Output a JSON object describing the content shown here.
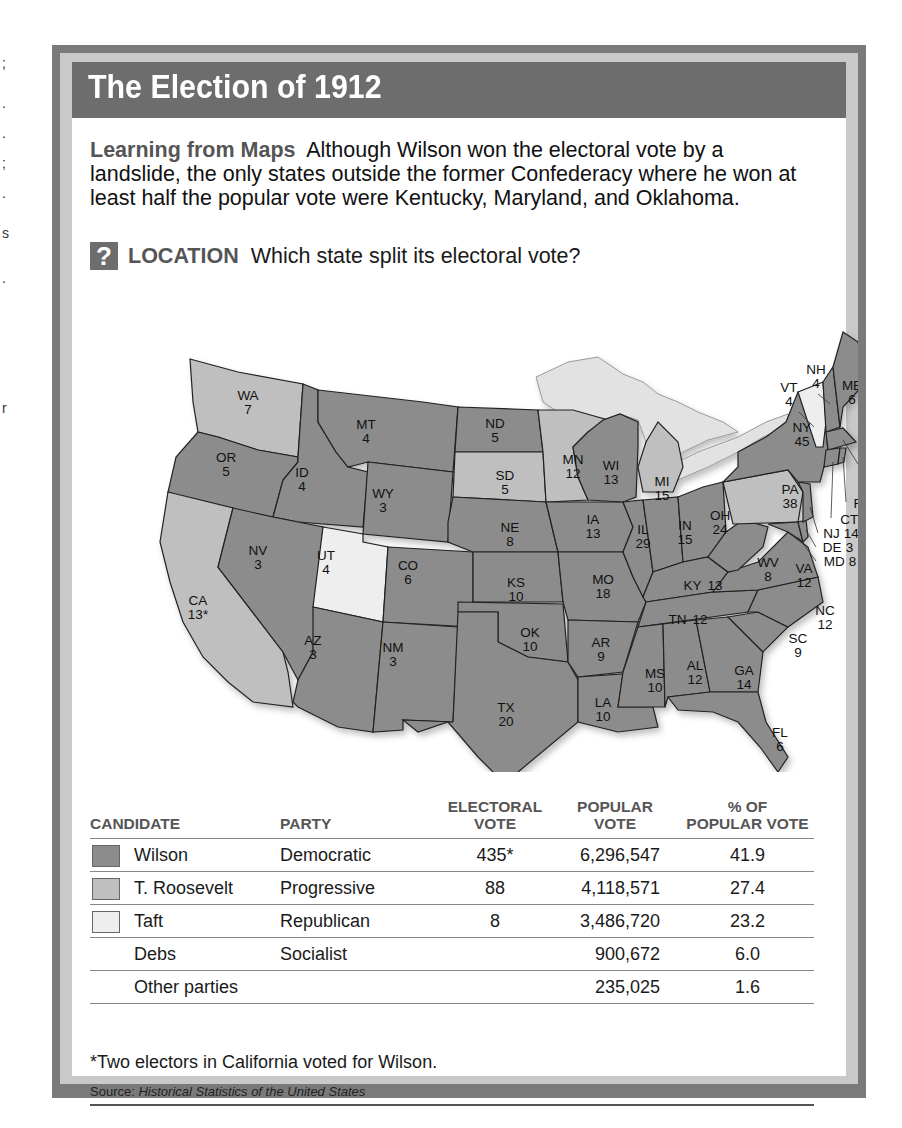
{
  "edge_marks": [
    ";",
    ".",
    ".",
    ";",
    ".",
    "s",
    ".",
    "r"
  ],
  "title": "The Election of 1912",
  "intro": {
    "lead": "Learning from Maps",
    "text": "Although Wilson won the electoral vote by a landslide, the only states outside the former Confederacy where he won at least half the popular vote were Kentucky, Maryland, and Oklahoma."
  },
  "question": {
    "icon": "?",
    "label": "LOCATION",
    "text": "Which state split its electoral vote?"
  },
  "colors": {
    "wilson": "#8c8c8c",
    "roosevelt": "#bfbfbf",
    "taft": "#eeeeee",
    "header": "#6d6d6d",
    "frame": "#7a7a7a",
    "lakes": "#e2e2e2"
  },
  "map": {
    "states": [
      {
        "abbr": "WA",
        "votes": "7",
        "winner": "roosevelt"
      },
      {
        "abbr": "OR",
        "votes": "5",
        "winner": "wilson"
      },
      {
        "abbr": "CA",
        "votes": "13*",
        "winner": "roosevelt"
      },
      {
        "abbr": "ID",
        "votes": "4",
        "winner": "wilson"
      },
      {
        "abbr": "NV",
        "votes": "3",
        "winner": "wilson"
      },
      {
        "abbr": "MT",
        "votes": "4",
        "winner": "wilson"
      },
      {
        "abbr": "WY",
        "votes": "3",
        "winner": "wilson"
      },
      {
        "abbr": "UT",
        "votes": "4",
        "winner": "taft"
      },
      {
        "abbr": "AZ",
        "votes": "3",
        "winner": "wilson"
      },
      {
        "abbr": "CO",
        "votes": "6",
        "winner": "wilson"
      },
      {
        "abbr": "NM",
        "votes": "3",
        "winner": "wilson"
      },
      {
        "abbr": "ND",
        "votes": "5",
        "winner": "wilson"
      },
      {
        "abbr": "SD",
        "votes": "5",
        "winner": "roosevelt"
      },
      {
        "abbr": "NE",
        "votes": "8",
        "winner": "wilson"
      },
      {
        "abbr": "KS",
        "votes": "10",
        "winner": "wilson"
      },
      {
        "abbr": "OK",
        "votes": "10",
        "winner": "wilson"
      },
      {
        "abbr": "TX",
        "votes": "20",
        "winner": "wilson"
      },
      {
        "abbr": "MN",
        "votes": "12",
        "winner": "roosevelt"
      },
      {
        "abbr": "IA",
        "votes": "13",
        "winner": "wilson"
      },
      {
        "abbr": "MO",
        "votes": "18",
        "winner": "wilson"
      },
      {
        "abbr": "AR",
        "votes": "9",
        "winner": "wilson"
      },
      {
        "abbr": "LA",
        "votes": "10",
        "winner": "wilson"
      },
      {
        "abbr": "WI",
        "votes": "13",
        "winner": "wilson"
      },
      {
        "abbr": "IL",
        "votes": "29",
        "winner": "wilson"
      },
      {
        "abbr": "MI",
        "votes": "15",
        "winner": "roosevelt"
      },
      {
        "abbr": "IN",
        "votes": "15",
        "winner": "wilson"
      },
      {
        "abbr": "OH",
        "votes": "24",
        "winner": "wilson"
      },
      {
        "abbr": "KY",
        "votes": "13",
        "winner": "wilson"
      },
      {
        "abbr": "TN",
        "votes": "12",
        "winner": "wilson"
      },
      {
        "abbr": "MS",
        "votes": "10",
        "winner": "wilson"
      },
      {
        "abbr": "AL",
        "votes": "12",
        "winner": "wilson"
      },
      {
        "abbr": "GA",
        "votes": "14",
        "winner": "wilson"
      },
      {
        "abbr": "FL",
        "votes": "6",
        "winner": "wilson"
      },
      {
        "abbr": "SC",
        "votes": "9",
        "winner": "wilson"
      },
      {
        "abbr": "NC",
        "votes": "12",
        "winner": "wilson"
      },
      {
        "abbr": "VA",
        "votes": "12",
        "winner": "wilson"
      },
      {
        "abbr": "WV",
        "votes": "8",
        "winner": "wilson"
      },
      {
        "abbr": "PA",
        "votes": "38",
        "winner": "roosevelt"
      },
      {
        "abbr": "NY",
        "votes": "45",
        "winner": "wilson"
      },
      {
        "abbr": "VT",
        "votes": "4",
        "winner": "taft"
      },
      {
        "abbr": "NH",
        "votes": "4",
        "winner": "wilson"
      },
      {
        "abbr": "ME",
        "votes": "6",
        "winner": "wilson"
      },
      {
        "abbr": "MA",
        "votes": "18",
        "winner": "wilson"
      },
      {
        "abbr": "RI",
        "votes": "5",
        "winner": "wilson"
      },
      {
        "abbr": "CT",
        "votes": "7",
        "winner": "wilson"
      },
      {
        "abbr": "NJ",
        "votes": "14",
        "winner": "wilson"
      },
      {
        "abbr": "DE",
        "votes": "3",
        "winner": "wilson"
      },
      {
        "abbr": "MD",
        "votes": "8",
        "winner": "wilson"
      }
    ],
    "callouts": {
      "NH": "NH\n4",
      "VT": "VT\n4",
      "MA": "MA\n18",
      "RI": "RI 5",
      "CT": "CT 7",
      "NJ": "NJ 14",
      "DE": "DE 3",
      "MD": "MD 8"
    }
  },
  "table": {
    "headers": {
      "candidate": "CANDIDATE",
      "party": "PARTY",
      "electoral_1": "ELECTORAL",
      "electoral_2": "VOTE",
      "popular_1": "POPULAR",
      "popular_2": "VOTE",
      "pct_1": "% OF",
      "pct_2": "POPULAR VOTE"
    },
    "rows": [
      {
        "candidate": "Wilson",
        "party": "Democratic",
        "electoral": "435*",
        "popular": "6,296,547",
        "pct": "41.9",
        "swatch": "wilson"
      },
      {
        "candidate": "T. Roosevelt",
        "party": "Progressive",
        "electoral": "88",
        "popular": "4,118,571",
        "pct": "27.4",
        "swatch": "roosevelt"
      },
      {
        "candidate": "Taft",
        "party": "Republican",
        "electoral": "8",
        "popular": "3,486,720",
        "pct": "23.2",
        "swatch": "taft"
      },
      {
        "candidate": "Debs",
        "party": "Socialist",
        "electoral": "",
        "popular": "900,672",
        "pct": "6.0",
        "swatch": null
      },
      {
        "candidate": "Other parties",
        "party": "",
        "electoral": "",
        "popular": "235,025",
        "pct": "1.6",
        "swatch": null
      }
    ]
  },
  "footnote": "*Two electors in California voted for Wilson.",
  "source": {
    "label": "Source:",
    "title": "Historical Statistics of the United States"
  }
}
